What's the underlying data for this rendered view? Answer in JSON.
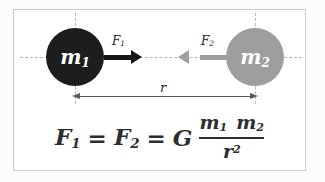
{
  "colors": {
    "mass1_fill": "#1d1d1d",
    "mass2_fill": "#9e9e9e",
    "force1_arrow": "#151515",
    "force2_arrow": "#9e9e9e",
    "guide_dash": "#b5b5b5",
    "dimension_line": "#5a5a5a",
    "frame_border": "#c9c9c9",
    "formula_text": "#2e2e2e"
  },
  "diagram": {
    "mass1_label": {
      "base": "m",
      "sub": "1"
    },
    "mass2_label": {
      "base": "m",
      "sub": "2"
    },
    "force1_label": {
      "base": "F",
      "sub": "1"
    },
    "force2_label": {
      "base": "F",
      "sub": "2"
    },
    "distance_label": "r"
  },
  "formula": {
    "lhs1": {
      "base": "F",
      "sub": "1"
    },
    "equals1": "=",
    "lhs2": {
      "base": "F",
      "sub": "2"
    },
    "equals2": "=",
    "constant": "G",
    "numerator": [
      {
        "base": "m",
        "sub": "1"
      },
      {
        "base": "m",
        "sub": "2"
      }
    ],
    "denominator": {
      "base": "r",
      "sup": "2"
    }
  }
}
